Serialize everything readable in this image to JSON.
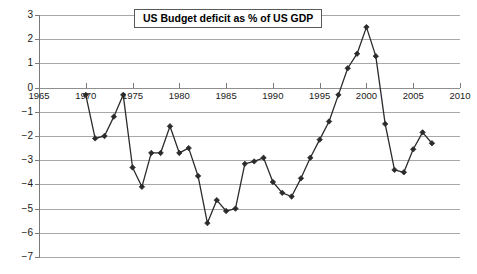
{
  "chart_data": {
    "type": "line",
    "title": "US Budget deficit as % of US GDP",
    "xlabel": "",
    "ylabel": "",
    "xlim": [
      1965,
      2010
    ],
    "ylim": [
      -7,
      3
    ],
    "grid": true,
    "legend": "none",
    "xticks": [
      1965,
      1970,
      1975,
      1980,
      1985,
      1990,
      1995,
      2000,
      2005,
      2010
    ],
    "xtick_labels": [
      "1965",
      "1970",
      "1975",
      "1980",
      "1985",
      "1990",
      "1995",
      "2000",
      "2005",
      "2010"
    ],
    "yticks": [
      3,
      2,
      1,
      0,
      -1,
      -2,
      -3,
      -4,
      -5,
      -6,
      -7
    ],
    "ytick_labels": [
      "3",
      "2",
      "1",
      "0",
      "−1",
      "−2",
      "−3",
      "−4",
      "−5",
      "−6",
      "−7"
    ],
    "marker": "diamond",
    "line_color": "#2b2b2b",
    "marker_color": "#2b2b2b",
    "grid_color": "#a8a8a8",
    "x": [
      1970,
      1971,
      1972,
      1973,
      1974,
      1975,
      1976,
      1977,
      1978,
      1979,
      1980,
      1981,
      1982,
      1983,
      1984,
      1985,
      1986,
      1987,
      1988,
      1989,
      1990,
      1991,
      1992,
      1993,
      1994,
      1995,
      1996,
      1997,
      1998,
      1999,
      2000,
      2001,
      2002,
      2003,
      2004,
      2005,
      2006,
      2007
    ],
    "values": [
      -0.3,
      -2.1,
      -2.0,
      -1.2,
      -0.3,
      -3.3,
      -4.1,
      -2.7,
      -2.7,
      -1.6,
      -2.7,
      -2.5,
      -3.65,
      -5.6,
      -4.65,
      -5.1,
      -5.0,
      -3.15,
      -3.05,
      -2.9,
      -3.9,
      -4.35,
      -4.5,
      -3.75,
      -2.9,
      -2.15,
      -1.4,
      -0.3,
      0.8,
      1.4,
      2.5,
      1.3,
      -1.5,
      -3.4,
      -3.5,
      -2.55,
      -1.85,
      -2.3
    ]
  }
}
